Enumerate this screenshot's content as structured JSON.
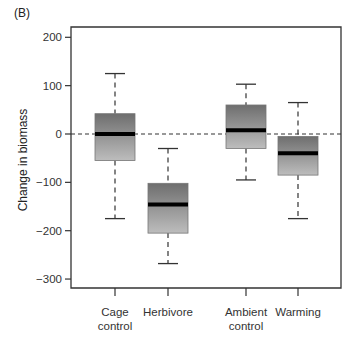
{
  "panel_label": "(B)",
  "chart_data": {
    "type": "box",
    "title": "",
    "panel": "(B)",
    "xlabel": "",
    "ylabel": "Change in biomass",
    "ylim": [
      -320,
      235
    ],
    "yticks": [
      200,
      100,
      0,
      -100,
      -200,
      -300
    ],
    "ytick_labels": [
      "200",
      "100",
      "0",
      "−100",
      "−200",
      "−300"
    ],
    "reference_line": {
      "y": 0,
      "style": "dashed"
    },
    "grid": false,
    "legend": null,
    "categories": [
      {
        "label_lines": [
          "Cage",
          "control"
        ]
      },
      {
        "label_lines": [
          "Herbivore"
        ]
      },
      {
        "label_lines": [
          "Ambient",
          "control"
        ]
      },
      {
        "label_lines": [
          "Warming"
        ]
      }
    ],
    "series": [
      {
        "name": "Cage control",
        "whisker_low": -175,
        "q1": -55,
        "median": 0,
        "q3": 42,
        "whisker_high": 125
      },
      {
        "name": "Herbivore",
        "whisker_low": -268,
        "q1": -205,
        "median": -146,
        "q3": -102,
        "whisker_high": -30
      },
      {
        "name": "Ambient control",
        "whisker_low": -95,
        "q1": -30,
        "median": 8,
        "q3": 60,
        "whisker_high": 103
      },
      {
        "name": "Warming",
        "whisker_low": -175,
        "q1": -85,
        "median": -40,
        "q3": -5,
        "whisker_high": 65
      }
    ]
  }
}
